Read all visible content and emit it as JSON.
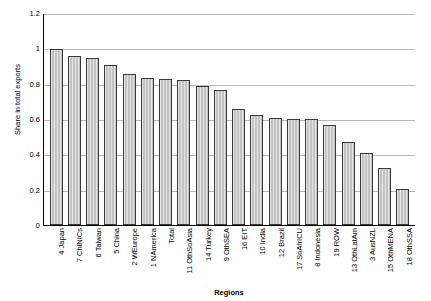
{
  "chart_data": {
    "type": "bar",
    "title": "",
    "xlabel": "Regions",
    "ylabel": "Share in total exports",
    "ylim": [
      0,
      1.2
    ],
    "yticks": [
      "0",
      "0.2",
      "0.4",
      "0.6",
      "0.8",
      "1",
      "1.2"
    ],
    "grid": true,
    "legend": "none",
    "categories": [
      "4 Japan",
      "7 ChiNICs",
      "6 Taiwan",
      "5 China",
      "2 WEurope",
      "1 NAmerica",
      "Total",
      "11 OthSoAsia",
      "14 Turkey",
      "9 OthSEA",
      "16 EIT",
      "10 India",
      "12 Brazil",
      "17 SoAfrICU",
      "8 Indonesia",
      "19 ROW",
      "13 OthLatAm",
      "3 AusNZL",
      "15 OthMENA",
      "18 OthSSA"
    ],
    "values": [
      0.995,
      0.955,
      0.945,
      0.905,
      0.855,
      0.83,
      0.825,
      0.82,
      0.785,
      0.765,
      0.655,
      0.625,
      0.605,
      0.6,
      0.6,
      0.565,
      0.47,
      0.41,
      0.325,
      0.205
    ]
  }
}
